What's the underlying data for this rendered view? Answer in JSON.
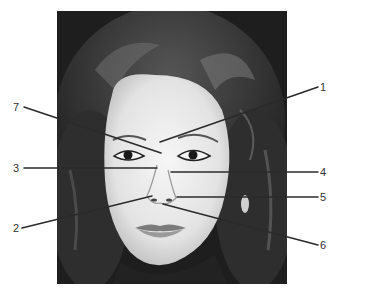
{
  "figure": {
    "type": "anatomical-face-diagram",
    "photo": {
      "subject": "frontal portrait of a woman's face",
      "frame": {
        "x": 57,
        "y": 11,
        "width": 230,
        "height": 273
      },
      "background_color": "#1f1f1f",
      "skin_color": "#ececec",
      "hair_color": "#2a2a2a"
    },
    "labels": [
      {
        "id": "1",
        "text": "1",
        "label_x": 322,
        "label_y": 91,
        "line": [
          [
            160,
            142
          ],
          [
            318,
            87
          ]
        ]
      },
      {
        "id": "2",
        "text": "2",
        "label_x": 14,
        "label_y": 232,
        "line": [
          [
            22,
            228
          ],
          [
            152,
            196
          ]
        ]
      },
      {
        "id": "3",
        "text": "3",
        "label_x": 14,
        "label_y": 172,
        "line": [
          [
            24,
            168
          ],
          [
            157,
            168
          ]
        ]
      },
      {
        "id": "4",
        "text": "4",
        "label_x": 322,
        "label_y": 176,
        "line": [
          [
            171,
            172
          ],
          [
            318,
            172
          ]
        ]
      },
      {
        "id": "5",
        "text": "5",
        "label_x": 322,
        "label_y": 200,
        "line": [
          [
            177,
            197
          ],
          [
            318,
            197
          ]
        ]
      },
      {
        "id": "6",
        "text": "6",
        "label_x": 322,
        "label_y": 249,
        "line": [
          [
            163,
            204
          ],
          [
            318,
            245
          ]
        ]
      },
      {
        "id": "7",
        "text": "7",
        "label_x": 14,
        "label_y": 112,
        "line": [
          [
            24,
            107
          ],
          [
            161,
            153
          ]
        ]
      }
    ],
    "line_color": "#2b2b2b",
    "label_color": "#333333"
  }
}
